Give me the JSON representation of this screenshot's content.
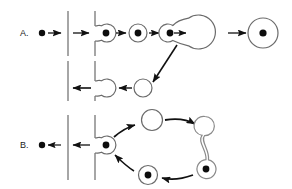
{
  "figure": {
    "width": 292,
    "height": 189,
    "background_color": "#ffffff",
    "stroke_color": "#4a4a4a",
    "dark_stroke_color": "#111111",
    "fill_color": "#0d0d0d",
    "panels": [
      {
        "id": "panel-a",
        "label": "A.",
        "label_x": 20,
        "label_y": 36,
        "description": "Vesicle budding and fusion pathway with membranes"
      },
      {
        "id": "panel-b",
        "label": "B.",
        "label_x": 20,
        "label_y": 148,
        "description": "Cyclic vesicle trafficking pathway with membranes"
      }
    ],
    "panel_a": {
      "cargo_dot": {
        "cx": 42,
        "cy": 33,
        "r": 3.2
      },
      "membranes": [
        {
          "name": "outer-membrane-top",
          "x": 68,
          "y1": 11,
          "y2": 56
        },
        {
          "name": "inner-membrane-top",
          "x": 95,
          "y1": 11,
          "y2": 56
        },
        {
          "name": "outer-membrane-bottom",
          "x": 68,
          "y1": 61,
          "y2": 101
        },
        {
          "name": "inner-membrane-bottom",
          "x": 95,
          "y1": 61,
          "y2": 101
        }
      ],
      "arrows": [
        {
          "name": "arrow-cargo-to-membrane",
          "x1": 48,
          "y1": 33,
          "x2": 62,
          "y2": 33
        },
        {
          "name": "arrow-across-membrane-gap",
          "x1": 73,
          "y1": 33,
          "x2": 90,
          "y2": 33
        },
        {
          "name": "arrow-bud-to-vesicle-1",
          "x1": 116,
          "y1": 33,
          "x2": 127,
          "y2": 33
        },
        {
          "name": "arrow-vesicle-1-to-2",
          "x1": 149,
          "y1": 33,
          "x2": 160,
          "y2": 33
        },
        {
          "name": "arrow-vesicle-2-to-endosome",
          "x1": 180,
          "y1": 33,
          "x2": 190,
          "y2": 33
        },
        {
          "name": "arrow-endosome-to-lysosome",
          "x1": 228,
          "y1": 33,
          "x2": 248,
          "y2": 33
        },
        {
          "name": "arrow-diagonal-recycling",
          "x1": 176,
          "y1": 46,
          "x2": 152,
          "y2": 83
        },
        {
          "name": "arrow-recycle-to-bud",
          "x1": 132,
          "y1": 88,
          "x2": 118,
          "y2": 88
        },
        {
          "name": "arrow-bud-to-outer-membrane",
          "x1": 90,
          "y1": 88,
          "x2": 72,
          "y2": 88
        }
      ],
      "shapes": [
        {
          "name": "budding-vesicle-at-membrane-top",
          "cx": 105,
          "cy": 33,
          "r": 9,
          "filled_core": true,
          "core_r": 3.4
        },
        {
          "name": "free-vesicle-1",
          "cx": 138,
          "cy": 33,
          "r": 9,
          "filled_core": true,
          "core_r": 3.4
        },
        {
          "name": "free-vesicle-2",
          "cx": 170,
          "cy": 33,
          "r": 9,
          "filled_core": true,
          "core_r": 3.4
        },
        {
          "name": "fusing-endosome",
          "cx": 205,
          "cy": 32,
          "r": 17,
          "filled_core": false
        },
        {
          "name": "lysosome",
          "cx": 263,
          "cy": 33,
          "r": 15,
          "filled_core": true,
          "core_r": 3.6
        },
        {
          "name": "recycling-vesicle-empty",
          "cx": 143,
          "cy": 88,
          "r": 9,
          "filled_core": false
        },
        {
          "name": "budding-vesicle-at-membrane-bottom",
          "cx": 105,
          "cy": 88,
          "r": 9,
          "filled_core": false
        }
      ]
    },
    "panel_b": {
      "cargo_dot": {
        "cx": 42,
        "cy": 145,
        "r": 3.2
      },
      "membranes": [
        {
          "name": "outer-membrane",
          "x": 68,
          "y1": 115,
          "y2": 180
        },
        {
          "name": "inner-membrane",
          "x": 95,
          "y1": 115,
          "y2": 180
        }
      ],
      "arrows": [
        {
          "name": "arrow-release-to-cargo",
          "x1": 62,
          "y1": 145,
          "x2": 48,
          "y2": 145
        },
        {
          "name": "arrow-across-membrane-gap",
          "x1": 90,
          "y1": 145,
          "x2": 73,
          "y2": 145
        },
        {
          "name": "arrow-bud-to-empty-vesicle",
          "x1": 114,
          "y1": 137,
          "x2": 136,
          "y2": 126
        },
        {
          "name": "arrow-empty-to-tethered",
          "x1": 166,
          "y1": 122,
          "x2": 196,
          "y2": 127
        },
        {
          "name": "arrow-tethered-to-loaded",
          "x1": 190,
          "y1": 173,
          "x2": 161,
          "y2": 177
        },
        {
          "name": "arrow-loaded-to-bud",
          "x1": 131,
          "y1": 172,
          "x2": 114,
          "y2": 154
        }
      ],
      "shapes": [
        {
          "name": "budding-vesicle-at-membrane",
          "cx": 105,
          "cy": 145,
          "r": 9,
          "filled_core": true,
          "core_r": 3.4
        },
        {
          "name": "empty-vesicle-top",
          "cx": 152,
          "cy": 120,
          "r": 10.5,
          "filled_core": false
        },
        {
          "name": "tethered-vesicle-upper",
          "cx": 205,
          "cy": 126,
          "r": 9.5,
          "filled_core": false
        },
        {
          "name": "tethered-vesicle-lower",
          "cx": 205,
          "cy": 169,
          "r": 9.5,
          "filled_core": true,
          "core_r": 3.4
        },
        {
          "name": "loaded-vesicle-bottom",
          "cx": 148,
          "cy": 175,
          "r": 9.5,
          "filled_core": true,
          "core_r": 3.4
        }
      ]
    }
  }
}
